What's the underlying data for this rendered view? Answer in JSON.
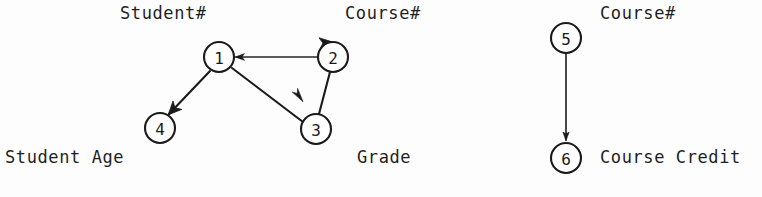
{
  "figure": {
    "background_color": "#fdfdfd",
    "ink_color": "#1a1a1a",
    "width": 762,
    "height": 197
  },
  "nodes": [
    {
      "id": "1",
      "label": "1",
      "cx": 219,
      "cy": 57,
      "r": 15,
      "attribute": "Student#"
    },
    {
      "id": "2",
      "label": "2",
      "cx": 333,
      "cy": 57,
      "r": 15,
      "attribute": "Course#"
    },
    {
      "id": "3",
      "label": "3",
      "cx": 316,
      "cy": 129,
      "r": 15,
      "attribute": "Grade"
    },
    {
      "id": "4",
      "label": "4",
      "cx": 160,
      "cy": 128,
      "r": 15,
      "attribute": "Student Age"
    },
    {
      "id": "5",
      "label": "5",
      "cx": 566,
      "cy": 38,
      "r": 15,
      "attribute": "Course#"
    },
    {
      "id": "6",
      "label": "6",
      "cx": 566,
      "cy": 158,
      "r": 15,
      "attribute": "Course Credit"
    }
  ],
  "edges": [
    {
      "id": "e-2-1",
      "from": "2",
      "to": "1",
      "kind": "arrow",
      "style": "thin"
    },
    {
      "id": "e-1-4",
      "from": "1",
      "to": "4",
      "kind": "arrow",
      "style": "thick"
    },
    {
      "id": "e-1-3",
      "from": "1",
      "to": "3",
      "kind": "plain",
      "style": "thick"
    },
    {
      "id": "e-2-3",
      "from": "2",
      "to": "3",
      "kind": "plain",
      "style": "thick"
    },
    {
      "id": "e-2-2",
      "from": "2",
      "to": "2",
      "kind": "self-loop",
      "style": "thick"
    },
    {
      "id": "e-5-6",
      "from": "5",
      "to": "6",
      "kind": "arrow",
      "style": "thin"
    }
  ],
  "markers": [
    {
      "id": "m-to-3",
      "x": 299,
      "y": 96,
      "angle": 55,
      "note": "detached arrowhead pointing toward node 3"
    }
  ],
  "labels": [
    {
      "id": "label-student-num",
      "text": "Student#",
      "x": 120,
      "y": 5,
      "for_node": "1"
    },
    {
      "id": "label-course-num-l",
      "text": "Course#",
      "x": 345,
      "y": 5,
      "for_node": "2"
    },
    {
      "id": "label-grade",
      "text": "Grade",
      "x": 357,
      "y": 149,
      "for_node": "3"
    },
    {
      "id": "label-student-age",
      "text": "Student Age",
      "x": 5,
      "y": 149,
      "for_node": "4"
    },
    {
      "id": "label-course-num-r",
      "text": "Course#",
      "x": 600,
      "y": 5,
      "for_node": "5"
    },
    {
      "id": "label-course-credit",
      "text": "Course Credit",
      "x": 600,
      "y": 149,
      "for_node": "6"
    }
  ]
}
